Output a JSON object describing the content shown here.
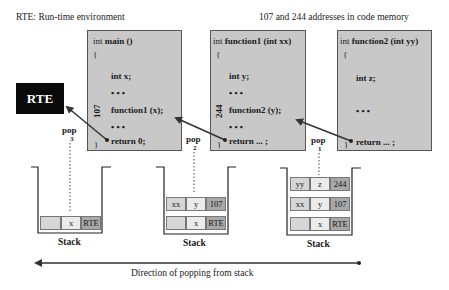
{
  "titles": {
    "legend": "RTE: Run-time environment",
    "addresses_note": "107 and 244 addresses in code memory"
  },
  "rte_box": {
    "label": "RTE"
  },
  "functions": [
    {
      "name": "main",
      "header_kw": "int",
      "header_rest": "main ()",
      "open_brace": "{",
      "lines": [
        "int x;",
        "• • •",
        "function1 (x);",
        "• • •",
        "return 0;"
      ],
      "close_brace": "}",
      "address": "107"
    },
    {
      "name": "function1",
      "header_kw": "int",
      "header_rest": "function1 (int xx)",
      "open_brace": "{",
      "lines": [
        "int y;",
        "• • •",
        "function2 (y);",
        "• • •",
        "return ... ;"
      ],
      "close_brace": "}",
      "address": "244"
    },
    {
      "name": "function2",
      "header_kw": "int",
      "header_rest": "function2 (int yy)",
      "open_brace": "{",
      "lines": [
        "int z;",
        "• • •",
        "return ... ;"
      ],
      "close_brace": "}"
    }
  ],
  "pops": [
    {
      "label": "pop",
      "number": "3"
    },
    {
      "label": "pop",
      "number": "2"
    },
    {
      "label": "pop",
      "number": "1"
    }
  ],
  "stacks": [
    {
      "label": "Stack",
      "frames": [
        [
          "",
          "x",
          "RTE"
        ]
      ]
    },
    {
      "label": "Stack",
      "frames": [
        [
          "xx",
          "y",
          "107"
        ],
        [
          "",
          "x",
          "RTE"
        ]
      ]
    },
    {
      "label": "Stack",
      "frames": [
        [
          "yy",
          "z",
          "244"
        ],
        [
          "xx",
          "y",
          "107"
        ],
        [
          "",
          "x",
          "RTE"
        ]
      ]
    }
  ],
  "direction": {
    "label": "Direction of popping from stack"
  },
  "colors": {
    "code_box_bg": "#c8c8c8",
    "rte_bg": "#0a0a0a",
    "cell_dark": "#a8a8a8",
    "cell_light": "#d6d6d6",
    "arrow": "#333333"
  }
}
